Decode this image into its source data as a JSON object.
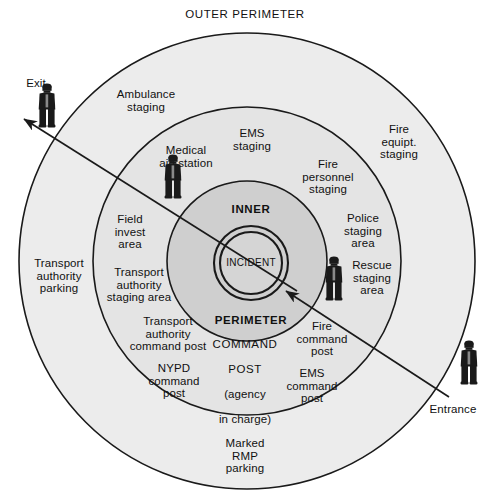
{
  "title": "OUTER PERIMETER",
  "colors": {
    "page_background": "#ffffff",
    "outer_ring_fill": "#ececec",
    "middle_ring_fill": "#e4e4e4",
    "inner_ring_fill": "#cfcfcf",
    "incident_fill": "#cfcfcf",
    "stroke": "#1a1a1a",
    "text": "#111111",
    "figure": "#1a1a1a"
  },
  "geometry": {
    "center_x": 247,
    "center_y": 261,
    "outer_radius": 228,
    "middle_radius": 154,
    "inner_radius": 80,
    "incident_outer_radius": 37,
    "incident_inner_radius": 31,
    "incident_center_x": 251,
    "incident_center_y": 263
  },
  "ring_labels": {
    "outer_perimeter": "OUTER PERIMETER",
    "inner": "INNER",
    "perimeter": "PERIMETER",
    "incident": "INCIDENT"
  },
  "command_post": {
    "line1": "COMMAND",
    "line2": "POST",
    "line3": "(agency",
    "line4": "in charge)"
  },
  "access_points": [
    {
      "name": "exit",
      "label": "Exit",
      "x": 36,
      "y": 83
    },
    {
      "name": "entrance",
      "label": "Entrance",
      "x": 453,
      "y": 409
    }
  ],
  "figures": [
    {
      "name": "exit-guard",
      "x": 47,
      "y": 132
    },
    {
      "name": "medical-aid-station-guard",
      "x": 173,
      "y": 203
    },
    {
      "name": "rescue-staging-guard",
      "x": 334,
      "y": 305
    },
    {
      "name": "entrance-guard",
      "x": 469,
      "y": 389
    }
  ],
  "zone_labels": [
    {
      "name": "ambulance-staging",
      "text": "Ambulance\nstaging",
      "x": 146,
      "y": 101,
      "ring": "outer"
    },
    {
      "name": "ems-staging",
      "text": "EMS\nstaging",
      "x": 252,
      "y": 140,
      "ring": "middle"
    },
    {
      "name": "medical-aid-station",
      "text": "Medical\naid station",
      "x": 186,
      "y": 157,
      "ring": "middle"
    },
    {
      "name": "fire-equipt-staging",
      "text": "Fire\nequipt.\nstaging",
      "x": 399,
      "y": 142,
      "ring": "outer"
    },
    {
      "name": "fire-personnel-staging",
      "text": "Fire\npersonnel\nstaging",
      "x": 328,
      "y": 177,
      "ring": "middle"
    },
    {
      "name": "police-staging-area",
      "text": "Police\nstaging\narea",
      "x": 363,
      "y": 231,
      "ring": "middle"
    },
    {
      "name": "rescue-staging-area",
      "text": "Rescue\nstaging\narea",
      "x": 372,
      "y": 278,
      "ring": "middle"
    },
    {
      "name": "field-invest-area",
      "text": "Field\ninvest\narea",
      "x": 130,
      "y": 232,
      "ring": "middle"
    },
    {
      "name": "transport-authority-parking",
      "text": "Transport\nauthority\nparking",
      "x": 59,
      "y": 276,
      "ring": "outer"
    },
    {
      "name": "transport-authority-staging-area",
      "text": "Transport\nauthority\nstaging area",
      "x": 139,
      "y": 285,
      "ring": "middle"
    },
    {
      "name": "transport-authority-command-post",
      "text": "Transport\nauthority\ncommand post",
      "x": 168,
      "y": 334,
      "ring": "middle"
    },
    {
      "name": "nypd-command-post",
      "text": "NYPD\ncommand\npost",
      "x": 174,
      "y": 381,
      "ring": "middle"
    },
    {
      "name": "fire-command-post",
      "text": "Fire\ncommand\npost",
      "x": 322,
      "y": 339,
      "ring": "middle"
    },
    {
      "name": "ems-command-post",
      "text": "EMS\ncommand\npost",
      "x": 312,
      "y": 386,
      "ring": "middle"
    },
    {
      "name": "marked-rmp-parking",
      "text": "Marked\nRMP\nparking",
      "x": 245,
      "y": 456,
      "ring": "outer"
    }
  ],
  "arrows": [
    {
      "name": "exit-arrow",
      "from_x": 297,
      "from_y": 291,
      "to_x": 24,
      "to_y": 119,
      "label": "Exit"
    },
    {
      "name": "entrance-arrow",
      "from_x": 449,
      "from_y": 397,
      "to_x": 286,
      "to_y": 291,
      "label": "Entrance"
    }
  ]
}
